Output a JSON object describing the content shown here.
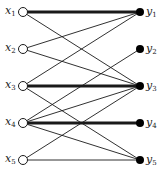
{
  "diagram": {
    "type": "bipartite-graph",
    "left_nodes": [
      {
        "id": "x1",
        "label": "x",
        "sub": "1",
        "y": 12
      },
      {
        "id": "x2",
        "label": "x",
        "sub": "2",
        "y": 49
      },
      {
        "id": "x3",
        "label": "x",
        "sub": "3",
        "y": 86
      },
      {
        "id": "x4",
        "label": "x",
        "sub": "4",
        "y": 123
      },
      {
        "id": "x5",
        "label": "x",
        "sub": "5",
        "y": 160
      }
    ],
    "right_nodes": [
      {
        "id": "y1",
        "label": "y",
        "sub": "1",
        "y": 12
      },
      {
        "id": "y2",
        "label": "y",
        "sub": "2",
        "y": 49
      },
      {
        "id": "y3",
        "label": "y",
        "sub": "3",
        "y": 86
      },
      {
        "id": "y4",
        "label": "y",
        "sub": "4",
        "y": 123
      },
      {
        "id": "y5",
        "label": "y",
        "sub": "5",
        "y": 160
      }
    ],
    "edges": [
      {
        "from": "x1",
        "to": "y1",
        "matched": true
      },
      {
        "from": "x1",
        "to": "y3",
        "matched": false
      },
      {
        "from": "x2",
        "to": "y1",
        "matched": false
      },
      {
        "from": "x2",
        "to": "y3",
        "matched": false
      },
      {
        "from": "x3",
        "to": "y1",
        "matched": false
      },
      {
        "from": "x3",
        "to": "y3",
        "matched": true
      },
      {
        "from": "x3",
        "to": "y5",
        "matched": false
      },
      {
        "from": "x4",
        "to": "y2",
        "matched": false
      },
      {
        "from": "x4",
        "to": "y3",
        "matched": false
      },
      {
        "from": "x4",
        "to": "y4",
        "matched": true
      },
      {
        "from": "x4",
        "to": "y5",
        "matched": false
      },
      {
        "from": "x5",
        "to": "y3",
        "matched": false
      },
      {
        "from": "x5",
        "to": "y5",
        "matched": false
      }
    ],
    "colors": {
      "line": "#1a1a1a",
      "node_fill_left": "#ffffff",
      "node_fill_right": "#000000"
    }
  }
}
